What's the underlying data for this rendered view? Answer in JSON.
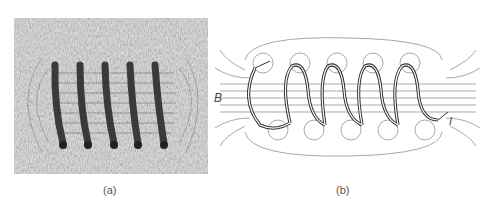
{
  "figure": {
    "panels": [
      {
        "id": "a",
        "caption": "(a)",
        "description": "Photograph of iron filings aligned around a 5-turn current-carrying solenoid"
      },
      {
        "id": "b",
        "caption": "(b)",
        "description": "Diagram of magnetic field lines of a 5-turn solenoid"
      }
    ],
    "labels": {
      "field": "B",
      "current": "I"
    },
    "coil_turns": 5,
    "colors": {
      "background": "#ffffff",
      "filings_bg": "#d8d8d8",
      "wire": "#3a3a3a",
      "field_lines": "#a8a8a8",
      "coil_outline": "#333333"
    }
  }
}
